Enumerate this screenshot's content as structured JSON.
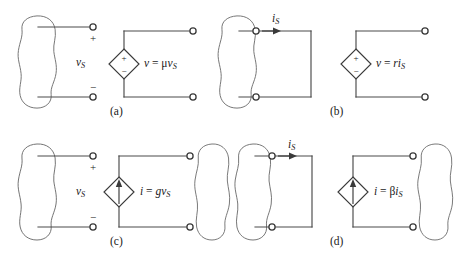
{
  "figure": {
    "background_color": "#ffffff",
    "wire_color": "#4a4a4a",
    "ink_color": "#1a1a1a"
  },
  "panels": [
    {
      "tag": "(a)",
      "name": "voltage-controlled-voltage-source",
      "control_variable": "v",
      "control_variable_sub": "S",
      "plus_sign": "+",
      "minus_sign": "−",
      "source_type": "voltage",
      "source_plus": "+",
      "source_minus": "−",
      "equation_lhs": "v",
      "equation_eq": "=",
      "equation_coeff": "μ",
      "equation_rhs_var": "v",
      "equation_rhs_sub": "S",
      "equation_text": "v = μv_S"
    },
    {
      "tag": "(b)",
      "name": "current-controlled-voltage-source",
      "control_variable": "i",
      "control_variable_sub": "S",
      "current_label": "i",
      "current_label_sub": "S",
      "source_type": "voltage",
      "source_plus": "+",
      "source_minus": "−",
      "equation_lhs": "v",
      "equation_eq": "=",
      "equation_coeff": "r",
      "equation_rhs_var": "i",
      "equation_rhs_sub": "S",
      "equation_text": "v = ri_S"
    },
    {
      "tag": "(c)",
      "name": "voltage-controlled-current-source",
      "control_variable": "v",
      "control_variable_sub": "S",
      "plus_sign": "+",
      "minus_sign": "−",
      "source_type": "current",
      "equation_lhs": "i",
      "equation_eq": "=",
      "equation_coeff": "g",
      "equation_rhs_var": "v",
      "equation_rhs_sub": "S",
      "equation_text": "i = gv_S"
    },
    {
      "tag": "(d)",
      "name": "current-controlled-current-source",
      "control_variable": "i",
      "control_variable_sub": "S",
      "current_label": "i",
      "current_label_sub": "S",
      "source_type": "current",
      "equation_lhs": "i",
      "equation_eq": "=",
      "equation_coeff": "β",
      "equation_rhs_var": "i",
      "equation_rhs_sub": "S",
      "equation_text": "i = βi_S"
    }
  ]
}
